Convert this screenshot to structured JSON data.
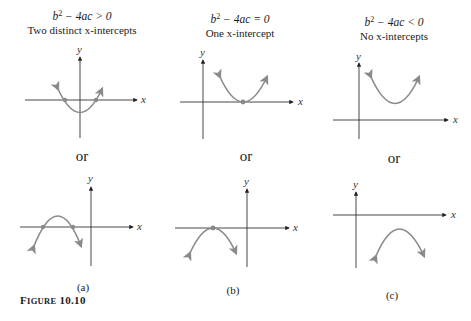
{
  "figure": {
    "label_prefix": "F",
    "label_rest": "IGURE",
    "number": "10.10",
    "full_label": "FIGURE 10.10"
  },
  "columns": [
    {
      "id": "a",
      "eq_lhs": "b",
      "eq_exp": "2",
      "eq_rhs": " − 4ac > 0",
      "caption": "Two distinct x-intercepts",
      "or": "or",
      "sublabel": "(a)"
    },
    {
      "id": "b",
      "eq_lhs": "b",
      "eq_exp": "2",
      "eq_rhs": " − 4ac = 0",
      "caption": "One x-intercept",
      "or": "or",
      "sublabel": "(b)"
    },
    {
      "id": "c",
      "eq_lhs": "b",
      "eq_exp": "2",
      "eq_rhs": " − 4ac < 0",
      "caption": "No x-intercepts",
      "or": "or",
      "sublabel": "(c)"
    }
  ],
  "axis_labels": {
    "x": "x",
    "y": "y"
  },
  "colors": {
    "parabola": "#8a8a8a",
    "axis": "#222222",
    "point": "#8a8a8a"
  }
}
